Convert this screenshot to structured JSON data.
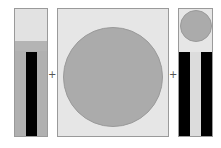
{
  "figure": {
    "operators": [
      "+",
      "+"
    ],
    "panels": [
      {
        "id": "left",
        "description": "tall box with light top region, gray band, gray lower region containing a vertical black bar",
        "colors": {
          "top": "#e2e2e2",
          "band": "#b4b4b4",
          "lower": "#b0b0b0",
          "bar": "#000000"
        }
      },
      {
        "id": "middle",
        "description": "large light box containing a large gray circle",
        "colors": {
          "background": "#e6e6e6",
          "circle": "#ababab"
        }
      },
      {
        "id": "right",
        "description": "narrow box with small gray circle on top and two vertical black bars below",
        "colors": {
          "background": "#e6e6e6",
          "circle": "#ababab",
          "bar": "#000000",
          "stripe": "#dcdcdc"
        }
      }
    ]
  }
}
